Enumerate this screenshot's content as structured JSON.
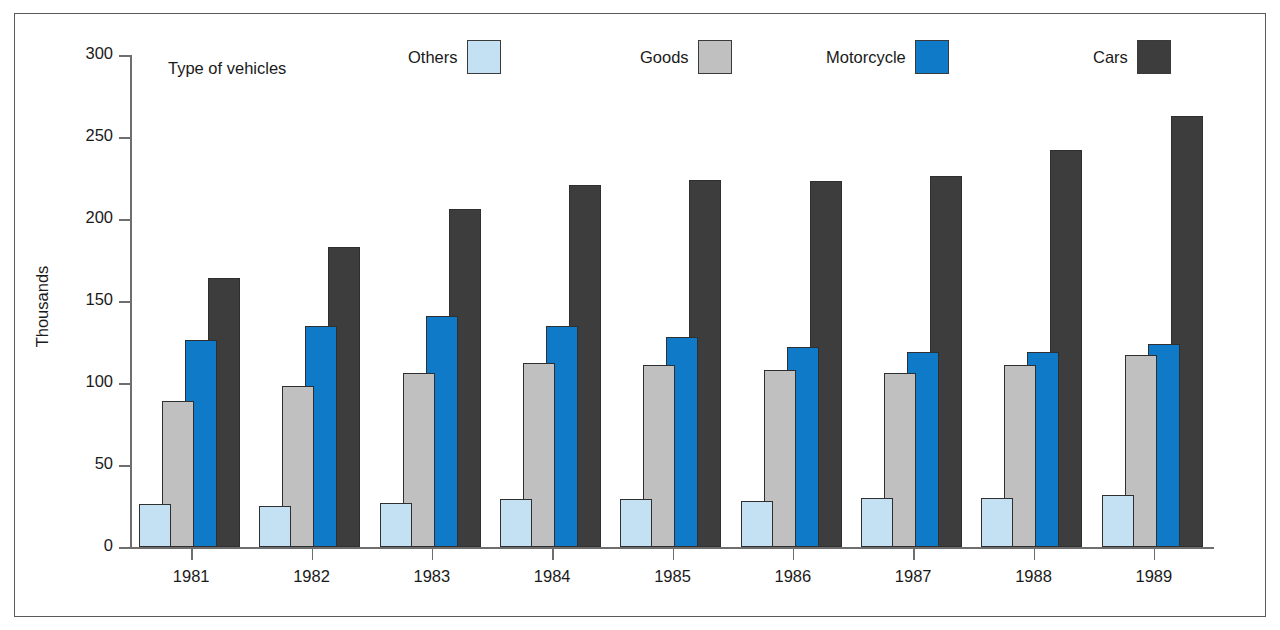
{
  "figure": {
    "border_color": "#5a5a5a",
    "background": "#ffffff"
  },
  "legend": {
    "title": "Type of vehicles",
    "entries": [
      {
        "label": "Others",
        "color": "#c3e1f2"
      },
      {
        "label": "Goods",
        "color": "#c0c0c0"
      },
      {
        "label": "Motorcycle",
        "color": "#0f7ac8"
      },
      {
        "label": "Cars",
        "color": "#3d3d3d"
      }
    ]
  },
  "axes": {
    "ylabel": "Thousands",
    "yticks": [
      "0",
      "50",
      "100",
      "150",
      "200",
      "250",
      "300"
    ],
    "xticks": [
      "1981",
      "1982",
      "1983",
      "1984",
      "1985",
      "1986",
      "1987",
      "1988",
      "1989"
    ]
  },
  "chart_data": {
    "type": "bar",
    "title": "",
    "subtitle": "",
    "xlabel": "",
    "ylabel": "Thousands",
    "ylim": [
      0,
      300
    ],
    "ytick_step": 50,
    "grid": false,
    "legend_position": "top",
    "legend_title": "Type of vehicles",
    "categories": [
      "1981",
      "1982",
      "1983",
      "1984",
      "1985",
      "1986",
      "1987",
      "1988",
      "1989"
    ],
    "series": [
      {
        "name": "Others",
        "color": "#c3e1f2",
        "values": [
          26,
          25,
          27,
          29,
          29,
          28,
          30,
          30,
          32
        ]
      },
      {
        "name": "Goods",
        "color": "#c0c0c0",
        "values": [
          89,
          98,
          106,
          112,
          111,
          108,
          106,
          111,
          117
        ]
      },
      {
        "name": "Motorcycle",
        "color": "#0f7ac8",
        "values": [
          126,
          135,
          141,
          135,
          128,
          122,
          119,
          119,
          124
        ]
      },
      {
        "name": "Cars",
        "color": "#3d3d3d",
        "values": [
          164,
          183,
          206,
          221,
          224,
          223,
          226,
          242,
          263
        ]
      }
    ]
  }
}
